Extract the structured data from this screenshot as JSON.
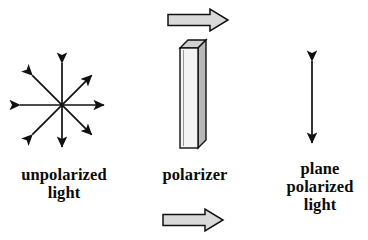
{
  "diagram": {
    "background_color": "#ffffff",
    "stroke_color": "#111111",
    "arrow_fill_color": "#d9d9d9",
    "slab_front_color": "#f2f2f2",
    "slab_side_color": "#b8b8b8",
    "slab_top_color": "#d0d0d0"
  },
  "labels": {
    "unpolarized": "unpolarized\nlight",
    "polarizer": "polarizer",
    "plane_polarized": "plane\npolarized\nlight"
  },
  "elements": {
    "unpolarized_star": {
      "name": "unpolarized-light-star",
      "description": "eight double-headed arrows radiating from a common center representing randomly oriented electric field vectors",
      "center": [
        62,
        105
      ],
      "arm_count": 8,
      "arm_length": 44,
      "angles_deg": [
        0,
        45,
        90,
        135,
        180,
        225,
        270,
        315
      ]
    },
    "polarizer_slab": {
      "name": "polarizer-slab",
      "description": "tall thin vertical 3D rectangular slab drawn in oblique projection",
      "front_face": {
        "x": 180,
        "y": 48,
        "width": 18,
        "height": 100
      },
      "depth_offset": [
        8,
        -8
      ]
    },
    "block_arrow_top": {
      "name": "incident-beam-arrow",
      "direction": "right",
      "x": 168,
      "y": 9,
      "width": 60,
      "height": 22
    },
    "block_arrow_bottom": {
      "name": "transmitted-beam-arrow",
      "direction": "right",
      "x": 163,
      "y": 209,
      "width": 60,
      "height": 22
    },
    "plane_polarized_arrow": {
      "name": "plane-polarized-double-arrow",
      "description": "single vertical double-headed arrow showing one plane of vibration",
      "x": 312,
      "y_top": 58,
      "y_bottom": 146
    }
  }
}
